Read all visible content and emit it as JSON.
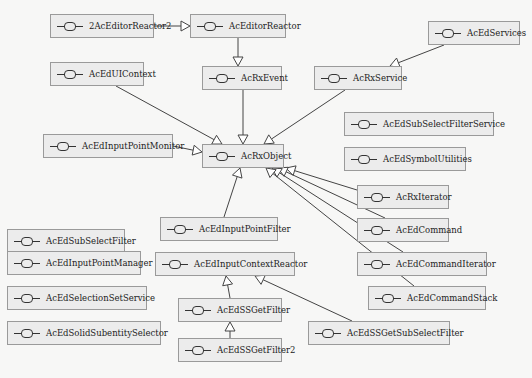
{
  "diagram": {
    "type": "class-inheritance",
    "root": "AcRxObject",
    "nodes": [
      {
        "id": "n2AcEditorReactor2",
        "label": "2AcEditorReactor2",
        "x": 50,
        "y": 14,
        "w": 104
      },
      {
        "id": "nAcEditorReactor",
        "label": "AcEditorReactor",
        "x": 190,
        "y": 14,
        "w": 96
      },
      {
        "id": "nAcEdServices",
        "label": "AcEdServices",
        "x": 428,
        "y": 21,
        "w": 92
      },
      {
        "id": "nAcEdUIContext",
        "label": "AcEdUIContext",
        "x": 50,
        "y": 62,
        "w": 94
      },
      {
        "id": "nAcRxEvent",
        "label": "AcRxEvent",
        "x": 202,
        "y": 66,
        "w": 80
      },
      {
        "id": "nAcRxService",
        "label": "AcRxService",
        "x": 314,
        "y": 66,
        "w": 88
      },
      {
        "id": "nAcEdSubSelectFilterService",
        "label": "AcEdSubSelectFilterService",
        "x": 344,
        "y": 112,
        "w": 150
      },
      {
        "id": "nAcEdInputPointMonitor",
        "label": "AcEdInputPointMonitor",
        "x": 43,
        "y": 134,
        "w": 130
      },
      {
        "id": "nAcRxObject",
        "label": "AcRxObject",
        "x": 202,
        "y": 144,
        "w": 82
      },
      {
        "id": "nAcEdSymbolUtilities",
        "label": "AcEdSymbolUtilities",
        "x": 344,
        "y": 147,
        "w": 122
      },
      {
        "id": "nAcRxIterator",
        "label": "AcRxIterator",
        "x": 357,
        "y": 185,
        "w": 92
      },
      {
        "id": "nAcEdInputPointFilter",
        "label": "AcEdInputPointFilter",
        "x": 160,
        "y": 217,
        "w": 118
      },
      {
        "id": "nAcEdCommand",
        "label": "AcEdCommand",
        "x": 357,
        "y": 218,
        "w": 92
      },
      {
        "id": "nAcEdSubSelectFilter",
        "label": "AcEdSubSelectFilter",
        "x": 7,
        "y": 229,
        "w": 118
      },
      {
        "id": "nAcEdInputPointManager",
        "label": "AcEdInputPointManager",
        "x": 7,
        "y": 251,
        "w": 134
      },
      {
        "id": "nAcEdInputContextReactor",
        "label": "AcEdInputContextReactor",
        "x": 155,
        "y": 252,
        "w": 140
      },
      {
        "id": "nAcEdCommandIterator",
        "label": "AcEdCommandIterator",
        "x": 357,
        "y": 252,
        "w": 130
      },
      {
        "id": "nAcEdSelectionSetService",
        "label": "AcEdSelectionSetService",
        "x": 7,
        "y": 286,
        "w": 140
      },
      {
        "id": "nAcEdCommandStack",
        "label": "AcEdCommandStack",
        "x": 368,
        "y": 286,
        "w": 118
      },
      {
        "id": "nAcEdSSGetFilter",
        "label": "AcEdSSGetFilter",
        "x": 178,
        "y": 298,
        "w": 104
      },
      {
        "id": "nAcEdSolidSubentitySelector",
        "label": "AcEdSolidSubentitySelector",
        "x": 7,
        "y": 321,
        "w": 154
      },
      {
        "id": "nAcEdSSGetSubSelectFilter",
        "label": "AcEdSSGetSubSelectFilter",
        "x": 308,
        "y": 321,
        "w": 142
      },
      {
        "id": "nAcEdSSGetFilter2",
        "label": "AcEdSSGetFilter2",
        "x": 178,
        "y": 338,
        "w": 104
      }
    ],
    "edges": [
      {
        "from": "2AcEditorReactor2",
        "to": "AcEditorReactor",
        "x1": 154,
        "y1": 26,
        "x2": 190,
        "y2": 26
      },
      {
        "from": "AcEditorReactor",
        "to": "AcRxEvent",
        "x1": 238,
        "y1": 38,
        "x2": 238,
        "y2": 66
      },
      {
        "from": "AcEdServices",
        "to": "AcRxService",
        "x1": 444,
        "y1": 45,
        "x2": 390,
        "y2": 66
      },
      {
        "from": "AcRxEvent",
        "to": "AcRxObject",
        "x1": 243,
        "y1": 90,
        "x2": 243,
        "y2": 144
      },
      {
        "from": "AcEdUIContext",
        "to": "AcRxObject",
        "x1": 116,
        "y1": 86,
        "x2": 222,
        "y2": 144
      },
      {
        "from": "AcRxService",
        "to": "AcRxObject",
        "x1": 345,
        "y1": 90,
        "x2": 264,
        "y2": 144
      },
      {
        "from": "AcEdInputPointMonitor",
        "to": "AcRxObject",
        "x1": 173,
        "y1": 146,
        "x2": 202,
        "y2": 152
      },
      {
        "from": "AcEdInputPointFilter",
        "to": "AcRxObject",
        "x1": 224,
        "y1": 217,
        "x2": 240,
        "y2": 168
      },
      {
        "from": "AcRxIterator",
        "to": "AcRxObject",
        "x1": 357,
        "y1": 190,
        "x2": 286,
        "y2": 168
      },
      {
        "from": "AcEdCommand",
        "to": "AcRxObject",
        "x1": 385,
        "y1": 218,
        "x2": 278,
        "y2": 168
      },
      {
        "from": "AcEdCommandIterator",
        "to": "AcRxObject",
        "x1": 403,
        "y1": 252,
        "x2": 272,
        "y2": 168
      },
      {
        "from": "AcEdCommandStack",
        "to": "AcRxObject",
        "x1": 414,
        "y1": 286,
        "x2": 266,
        "y2": 168
      },
      {
        "from": "AcEdSSGetFilter",
        "to": "AcEdInputContextReactor",
        "x1": 230,
        "y1": 298,
        "x2": 226,
        "y2": 276
      },
      {
        "from": "AcEdSSGetSubSelectFilter",
        "to": "AcEdInputContextReactor",
        "x1": 352,
        "y1": 321,
        "x2": 255,
        "y2": 276
      },
      {
        "from": "AcEdSSGetFilter2",
        "to": "AcEdSSGetFilter",
        "x1": 230,
        "y1": 338,
        "x2": 230,
        "y2": 322
      }
    ]
  },
  "colors": {
    "background": "#f7f7f6",
    "node_fill": "#ececec",
    "node_border": "#9a9a9a",
    "edge": "#444444"
  }
}
